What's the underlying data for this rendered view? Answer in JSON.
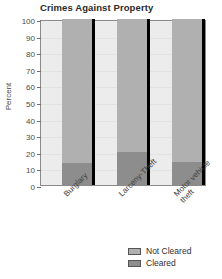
{
  "chart_data": {
    "type": "bar",
    "subtype": "stacked-bar-100",
    "title": "Crimes Against Property",
    "xlabel": "",
    "ylabel": "Percent",
    "ylim": [
      0,
      100
    ],
    "yticks": [
      0,
      10,
      20,
      30,
      40,
      50,
      60,
      70,
      80,
      90,
      100
    ],
    "ytick_labels": [
      "0",
      "10",
      "20",
      "30",
      "40",
      "50",
      "60",
      "70",
      "80",
      "90",
      "100"
    ],
    "grid": true,
    "legend_position": "bottom-right",
    "categories": [
      "Burglary",
      "Larceny-Theft",
      "Motor vehicle theft"
    ],
    "category_labels": [
      "Burglary",
      "Larceny-Theft",
      "Motor vehicle\ntheft"
    ],
    "series": [
      {
        "name": "Not Cleared",
        "color": "#b0b0b0",
        "values": [
          87,
          80,
          86
        ]
      },
      {
        "name": "Cleared",
        "color": "#8d8d8d",
        "values": [
          13,
          20,
          14
        ]
      }
    ]
  },
  "legend": {
    "items": [
      {
        "label": "Not Cleared",
        "color": "#b0b0b0"
      },
      {
        "label": "Cleared",
        "color": "#8d8d8d"
      }
    ]
  },
  "colors": {
    "plot_background": "#ececec",
    "frame": "#8a8a8a",
    "gridline": "#e2e2e2",
    "bar_shadow": "#000000",
    "text": "#3a3a3a"
  }
}
